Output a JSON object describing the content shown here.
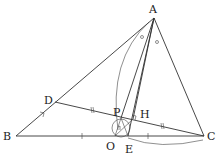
{
  "diagram": {
    "points": {
      "A": {
        "label": "A",
        "x": 154,
        "y": 18,
        "lx": 149,
        "ly": 13
      },
      "B": {
        "label": "B",
        "x": 16,
        "y": 136,
        "lx": 3,
        "ly": 140
      },
      "C": {
        "label": "C",
        "x": 204,
        "y": 136,
        "lx": 207,
        "ly": 140
      },
      "D": {
        "label": "D",
        "x": 55,
        "y": 102,
        "lx": 44,
        "ly": 104
      },
      "O": {
        "label": "O",
        "x": 115,
        "y": 136,
        "lx": 106,
        "ly": 150
      },
      "E": {
        "label": "E",
        "x": 128,
        "y": 136,
        "lx": 125,
        "ly": 153
      },
      "P": {
        "label": "P",
        "x": 121,
        "y": 118,
        "lx": 113,
        "ly": 116
      },
      "H": {
        "label": "H",
        "x": 133,
        "y": 119,
        "lx": 140,
        "ly": 118
      }
    },
    "marks": {
      "equal_angle": "○",
      "equal_segment_double": "//",
      "equal_segment_single": "|"
    }
  }
}
